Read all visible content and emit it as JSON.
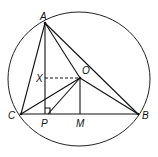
{
  "diagram": {
    "type": "geometry",
    "points": {
      "A": {
        "label": "A",
        "x": 45,
        "y": 23
      },
      "B": {
        "label": "B",
        "x": 138,
        "y": 114
      },
      "C": {
        "label": "C",
        "x": 21,
        "y": 114
      },
      "O": {
        "label": "O",
        "x": 80,
        "y": 78
      },
      "P": {
        "label": "P",
        "x": 45,
        "y": 114
      },
      "M": {
        "label": "M",
        "x": 80,
        "y": 114
      },
      "X": {
        "label": "X",
        "x": 45,
        "y": 78
      }
    },
    "segments": [
      "AB",
      "AC",
      "CB",
      "AP",
      "AO",
      "OB",
      "OC",
      "OP",
      "OM"
    ],
    "dashed_segments": [
      "XO"
    ],
    "right_angle_marker": "P",
    "circle": {
      "cx": 79,
      "cy": 79,
      "rx": 71,
      "ry": 67
    }
  }
}
